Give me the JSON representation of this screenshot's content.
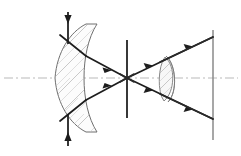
{
  "figure": {
    "title": "Converging lens ray diagram",
    "background_color": "#ffffff",
    "ink_color": "#1d1d1d",
    "axis_color": "#b9b9b9",
    "glass_fill": "#fcfcfc",
    "glass_edge": "#6f6f6f",
    "hatch_color": "#a6a6a6"
  },
  "canvas": {
    "width": 241,
    "height": 156
  },
  "optical_axis": {
    "label": "optical-axis",
    "style": "dash-dot",
    "y": 78,
    "x_start": 4,
    "x_end": 238,
    "color": "#b9b9b9"
  },
  "elements": {
    "main_lens": {
      "label": "thick convex lens",
      "center_x": 78,
      "top_y": 24,
      "bottom_y": 132,
      "front_vertex_x": 55,
      "back_vertex_x": 97,
      "edge_x": 97,
      "hatched": true
    },
    "input_aperture": {
      "label": "entrance aperture stop",
      "x": 68,
      "top_y": 12,
      "bottom_y": 146,
      "arrow_top": "down",
      "arrow_bottom": "up"
    },
    "focal_stop": {
      "label": "focal plane stop",
      "x": 127,
      "top_y": 40,
      "bottom_y": 118
    },
    "focal_point": {
      "label": "focal point",
      "x": 127,
      "y": 78
    },
    "small_lens": {
      "label": "crescent correcting lens",
      "center_x": 170,
      "top_y": 56,
      "bottom_y": 102,
      "hatched": true
    },
    "image_plane": {
      "label": "image plane screen",
      "x": 213,
      "top_y": 30,
      "bottom_y": 140
    }
  },
  "rays": {
    "count": 4,
    "color": "#1d1d1d",
    "arrowheads": 8,
    "upper_entry_y": 40,
    "lower_entry_y": 116,
    "upper_exit_y": 34,
    "lower_exit_y": 122
  }
}
